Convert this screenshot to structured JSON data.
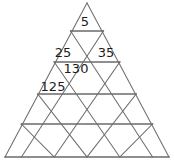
{
  "figure": {
    "type": "triangular-number-grid",
    "rows": 5,
    "colors": {
      "background": "#ffffff",
      "grid_line": "#6e6e6e",
      "grid_line_strong": "#6a6a6a",
      "text": "#1c1c1c"
    },
    "geometry": {
      "apex_x": 87,
      "apex_y": 3,
      "base_left_x": 5,
      "base_right_x": 169,
      "base_y": 157,
      "row_divider_y": [
        31,
        62,
        94,
        124,
        157
      ]
    },
    "labels": [
      {
        "id": "cell-r1-up-1",
        "text": "5",
        "row": 1,
        "orientation": "up",
        "index": 1,
        "x": 85,
        "y": 21
      },
      {
        "id": "cell-r2-up-1",
        "text": "25",
        "row": 2,
        "orientation": "up",
        "index": 1,
        "x": 63,
        "y": 52
      },
      {
        "id": "cell-r2-up-2",
        "text": "35",
        "row": 2,
        "orientation": "up",
        "index": 2,
        "x": 106,
        "y": 52
      },
      {
        "id": "cell-r3-down-1",
        "text": "130",
        "row": 3,
        "orientation": "down",
        "index": 1,
        "x": 76,
        "y": 68
      },
      {
        "id": "cell-r3-up-1",
        "text": "125",
        "row": 3,
        "orientation": "up",
        "index": 1,
        "x": 53,
        "y": 86
      }
    ]
  }
}
